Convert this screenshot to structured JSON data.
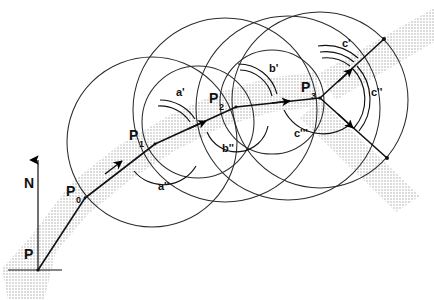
{
  "figure": {
    "background_color": "#ffffff",
    "line_color": "#000000",
    "circle_color": "#2b2b2b",
    "band_color": "#b9b9b9",
    "width": 434,
    "height": 300
  },
  "points": [
    {
      "id": "P",
      "label": "P",
      "sub": "",
      "x": 38,
      "y": 270,
      "label_x": 24,
      "label_y": 259
    },
    {
      "id": "P0",
      "label": "P",
      "sub": "0",
      "x": 85,
      "y": 198,
      "label_x": 66,
      "label_y": 196
    },
    {
      "id": "P1",
      "label": "P",
      "sub": "1",
      "x": 155,
      "y": 144,
      "label_x": 129,
      "label_y": 140
    },
    {
      "id": "P2",
      "label": "P",
      "sub": "2",
      "x": 236,
      "y": 107,
      "label_x": 209,
      "label_y": 103
    },
    {
      "id": "P3",
      "label": "P",
      "sub": "3",
      "x": 320,
      "y": 98,
      "label_x": 301,
      "label_y": 92
    }
  ],
  "path_vertices": [
    {
      "x": 38,
      "y": 270
    },
    {
      "x": 85,
      "y": 198
    },
    {
      "x": 155,
      "y": 144
    },
    {
      "x": 236,
      "y": 107
    },
    {
      "x": 320,
      "y": 98
    }
  ],
  "branches": [
    {
      "from": "P3",
      "to_x": 383,
      "to_y": 40,
      "name": "upper-branch"
    },
    {
      "from": "P3",
      "to_x": 386,
      "to_y": 157,
      "name": "lower-branch"
    }
  ],
  "north_arrow": {
    "label": "N",
    "x": 38,
    "y_base": 270,
    "y_tip": 155,
    "label_x": 26,
    "label_y": 182
  },
  "baseline": {
    "name": "horizon-line",
    "x1": 8,
    "x2": 62,
    "y": 270
  },
  "angle_labels": [
    {
      "id": "a1",
      "text": "a'",
      "x": 176,
      "y": 96,
      "ticks": 2,
      "name": "angle-label-a-prime"
    },
    {
      "id": "a2",
      "text": "a''",
      "x": 158,
      "y": 190,
      "ticks": 1,
      "name": "angle-label-a-double-prime"
    },
    {
      "id": "b1",
      "text": "b'",
      "x": 269,
      "y": 72,
      "ticks": 2,
      "name": "angle-label-b-prime"
    },
    {
      "id": "b2",
      "text": "b''",
      "x": 222,
      "y": 152,
      "ticks": 1,
      "name": "angle-label-b-double-prime"
    },
    {
      "id": "c1",
      "text": "c'",
      "x": 342,
      "y": 47,
      "ticks": 3,
      "name": "angle-label-c-prime"
    },
    {
      "id": "c2",
      "text": "c''",
      "x": 371,
      "y": 96,
      "ticks": 2,
      "name": "angle-label-c-double-prime"
    },
    {
      "id": "c3",
      "text": "c'''",
      "x": 294,
      "y": 137,
      "ticks": 1,
      "name": "angle-label-c-triple-prime"
    }
  ],
  "circles": [
    {
      "id": "circle-1",
      "cx": 152,
      "cy": 142,
      "r": 85,
      "name": "circle-around-p1"
    },
    {
      "id": "circle-2",
      "cx": 225,
      "cy": 110,
      "r": 92,
      "name": "circle-around-p2"
    },
    {
      "id": "circle-3",
      "cx": 288,
      "cy": 108,
      "r": 92,
      "name": "circle-around-p3-inner"
    },
    {
      "id": "circle-4",
      "cx": 320,
      "cy": 100,
      "r": 88,
      "name": "circle-around-p3-outer"
    },
    {
      "id": "circle-5",
      "cx": 198,
      "cy": 122,
      "r": 56,
      "name": "small-circle-between-p1-p2"
    },
    {
      "id": "circle-6",
      "cx": 272,
      "cy": 102,
      "r": 52,
      "name": "small-circle-between-p2-p3"
    }
  ],
  "bands": [
    {
      "id": "band-main",
      "name": "dotted-band-main",
      "description": "shaded corridor along the main path"
    },
    {
      "id": "band-upper",
      "name": "dotted-band-upper",
      "description": "shaded corridor along the upper branch"
    },
    {
      "id": "band-lower",
      "name": "dotted-band-lower",
      "description": "shaded corridor along the lower branch"
    }
  ],
  "arrow_markers": [
    {
      "name": "direction-arrow-p0-p1",
      "x": 121,
      "y": 170
    },
    {
      "name": "direction-arrow-a-prime",
      "x": 190,
      "y": 122
    },
    {
      "name": "direction-arrow-p1-p2",
      "x": 205,
      "y": 126
    },
    {
      "name": "direction-arrow-b-prime",
      "x": 272,
      "y": 100
    },
    {
      "name": "direction-arrow-b-double-prime",
      "x": 287,
      "y": 107
    },
    {
      "name": "direction-arrow-c-prime",
      "x": 349,
      "y": 61
    },
    {
      "name": "direction-arrow-c-double-prime",
      "x": 352,
      "y": 120
    }
  ]
}
